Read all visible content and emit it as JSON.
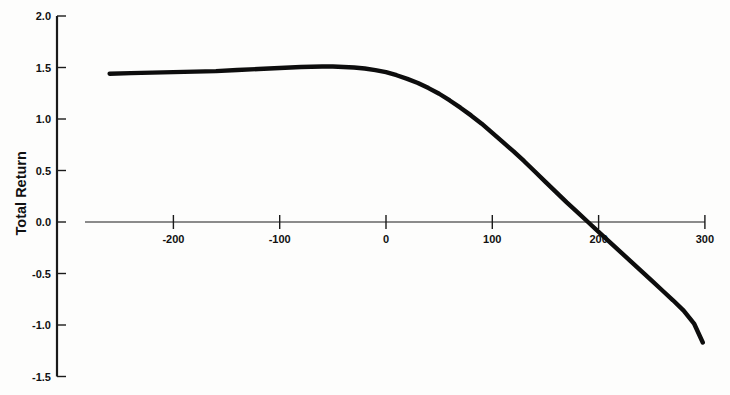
{
  "figure": {
    "background_color": "#fdfdfc",
    "ink_color": "#0d0d0d"
  },
  "chart_data": {
    "type": "line",
    "title": "",
    "subtitle": "",
    "xlabel": "",
    "ylabel": "Total Return",
    "xlim": [
      -260,
      300
    ],
    "ylim": [
      -1.5,
      2.0
    ],
    "grid": false,
    "legend": null,
    "x_ticks": [
      -200,
      -100,
      0,
      100,
      200,
      300
    ],
    "x_tick_labels": [
      "-200",
      "-100",
      "0",
      "100",
      "200",
      "300"
    ],
    "y_ticks": [
      -1.5,
      -1.0,
      -0.5,
      0.0,
      0.5,
      1.0,
      1.5,
      2.0
    ],
    "y_tick_labels": [
      "-1.5",
      "-1.0",
      "-0.5",
      "0.0",
      "0.5",
      "1.0",
      "1.5",
      "2.0"
    ],
    "zero_line_y": 0.0,
    "series": [
      {
        "name": "Total Return",
        "color": "#0d0d0d",
        "line_width": 4.4,
        "x": [
          -260,
          -240,
          -220,
          -200,
          -180,
          -160,
          -140,
          -120,
          -100,
          -80,
          -60,
          -50,
          -40,
          -30,
          -20,
          -10,
          0,
          10,
          20,
          30,
          40,
          50,
          60,
          70,
          80,
          90,
          100,
          110,
          120,
          130,
          140,
          150,
          160,
          170,
          180,
          190,
          200,
          210,
          220,
          230,
          240,
          250,
          260,
          270,
          280,
          290,
          298
        ],
        "y": [
          1.44,
          1.445,
          1.45,
          1.455,
          1.46,
          1.465,
          1.475,
          1.485,
          1.495,
          1.505,
          1.51,
          1.51,
          1.505,
          1.5,
          1.49,
          1.475,
          1.455,
          1.425,
          1.39,
          1.35,
          1.3,
          1.245,
          1.18,
          1.11,
          1.035,
          0.955,
          0.865,
          0.775,
          0.685,
          0.59,
          0.49,
          0.39,
          0.29,
          0.19,
          0.095,
          0.0,
          -0.095,
          -0.19,
          -0.285,
          -0.38,
          -0.475,
          -0.57,
          -0.665,
          -0.76,
          -0.86,
          -0.99,
          -1.17
        ]
      }
    ]
  }
}
